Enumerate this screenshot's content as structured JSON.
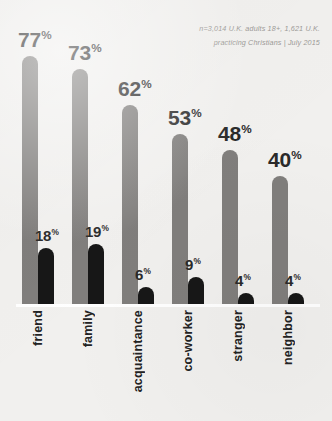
{
  "source_note": {
    "line1": "n=3,014 U.K. adults 18+, 1,621 U.K.",
    "line2": "practicing Christians | July 2015"
  },
  "colors": {
    "background": "#f1f0ee",
    "primary_bar": "#807e7c",
    "secondary_bar": "#171717",
    "label_text": "#2a2a2a",
    "note_text": "#9c9a97",
    "baseline": "#ffffff"
  },
  "chart_data": {
    "type": "bar",
    "title": "",
    "subtitle": "",
    "xlabel": "",
    "ylabel": "",
    "ylim": [
      0,
      100
    ],
    "grid": false,
    "legend_position": "none",
    "annotations": [
      "n=3,014 U.K. adults 18+, 1,621 U.K.",
      "practicing Christians | July 2015"
    ],
    "categories": [
      "friend",
      "family",
      "acquaintance",
      "co-worker",
      "stranger",
      "neighbor"
    ],
    "series": [
      {
        "name": "all U.K. adults",
        "color": "#807e7c",
        "values": [
          77,
          73,
          62,
          53,
          48,
          40
        ],
        "labels": [
          "77",
          "73",
          "62",
          "53",
          "48",
          "40"
        ]
      },
      {
        "name": "U.K. practicing Christians",
        "color": "#171717",
        "values": [
          18,
          19,
          6,
          9,
          4,
          4
        ],
        "labels": [
          "18",
          "19",
          "6",
          "9",
          "4",
          "4"
        ]
      }
    ],
    "value_suffix": "%"
  }
}
